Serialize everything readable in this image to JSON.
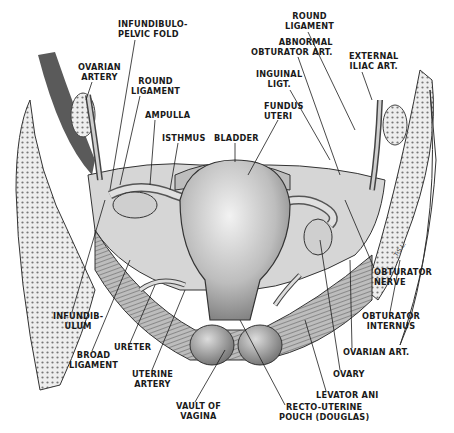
{
  "figure": {
    "signature": "T.S.L.",
    "labels": [
      {
        "id": "infundibulo-pelvic-fold",
        "text": "INFUNDIBULO-\nPELVIC FOLD",
        "x": 118,
        "y": 20,
        "align": "left"
      },
      {
        "id": "ovarian-artery",
        "text": "OVARIAN\nARTERY",
        "x": 80,
        "y": 63,
        "align": "center"
      },
      {
        "id": "round-ligament-left",
        "text": "ROUND\nLIGAMENT",
        "x": 132,
        "y": 77,
        "align": "left"
      },
      {
        "id": "ampulla",
        "text": "AMPULLA",
        "x": 145,
        "y": 111,
        "align": "left"
      },
      {
        "id": "isthmus",
        "text": "ISTHMUS",
        "x": 162,
        "y": 134,
        "align": "left"
      },
      {
        "id": "bladder",
        "text": "BLADDER",
        "x": 214,
        "y": 134,
        "align": "left"
      },
      {
        "id": "round-ligament-right",
        "text": "ROUND\nLIGAMENT",
        "x": 285,
        "y": 12,
        "align": "center"
      },
      {
        "id": "abnormal-obturator-art",
        "text": "ABNORMAL\nOBTURATOR ART.",
        "x": 251,
        "y": 38,
        "align": "right"
      },
      {
        "id": "external-iliac-art",
        "text": "EXTERNAL\nILIAC ART.",
        "x": 351,
        "y": 52,
        "align": "center"
      },
      {
        "id": "inguinal-ligt",
        "text": "INGUINAL\nLIGT.",
        "x": 256,
        "y": 70,
        "align": "center"
      },
      {
        "id": "fundus-uteri",
        "text": "FUNDUS\nUTERI",
        "x": 264,
        "y": 102,
        "align": "left"
      },
      {
        "id": "obturator-nerve",
        "text": "OBTURATOR\nNERVE",
        "x": 374,
        "y": 268,
        "align": "left"
      },
      {
        "id": "obturator-internus",
        "text": "OBTURATOR\nINTERNUS",
        "x": 362,
        "y": 312,
        "align": "left"
      },
      {
        "id": "ovarian-art-right",
        "text": "OVARIAN ART.",
        "x": 343,
        "y": 348,
        "align": "left"
      },
      {
        "id": "ovary",
        "text": "OVARY",
        "x": 333,
        "y": 370,
        "align": "left"
      },
      {
        "id": "levator-ani",
        "text": "LEVATOR ANI",
        "x": 316,
        "y": 391,
        "align": "left"
      },
      {
        "id": "recto-uterine-pouch",
        "text": "RECTO-UTERINE\nPOUCH (DOUGLAS)",
        "x": 279,
        "y": 403,
        "align": "left"
      },
      {
        "id": "infundibulum",
        "text": "INFUNDIB-\nULUM",
        "x": 53,
        "y": 312,
        "align": "left"
      },
      {
        "id": "broad-ligament",
        "text": "BROAD\nLIGAMENT",
        "x": 69,
        "y": 351,
        "align": "left"
      },
      {
        "id": "ureter",
        "text": "URETER",
        "x": 114,
        "y": 343,
        "align": "left"
      },
      {
        "id": "uterine-artery",
        "text": "UTERINE\nARTERY",
        "x": 132,
        "y": 370,
        "align": "left"
      },
      {
        "id": "vault-of-vagina",
        "text": "VAULT OF\nVAGINA",
        "x": 176,
        "y": 402,
        "align": "left"
      }
    ]
  },
  "colors": {
    "ink": "#1a1a1a",
    "tissue": "#c8c8c8",
    "muscle": "#9a9a9a",
    "bone": "#e6e6e6",
    "dark": "#555555"
  }
}
